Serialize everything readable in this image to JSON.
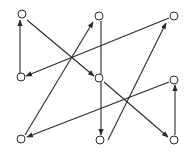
{
  "diagram": {
    "type": "directed-graph",
    "background": "#ffffff",
    "stroke_color": "#2a2a2a",
    "node_radius": 4,
    "nodes": [
      {
        "id": "TL",
        "x": 22,
        "y": 14
      },
      {
        "id": "TM",
        "x": 99,
        "y": 16
      },
      {
        "id": "TR",
        "x": 174,
        "y": 16
      },
      {
        "id": "ML",
        "x": 21,
        "y": 77
      },
      {
        "id": "MM",
        "x": 99,
        "y": 78
      },
      {
        "id": "MR",
        "x": 174,
        "y": 80
      },
      {
        "id": "BL",
        "x": 21,
        "y": 139
      },
      {
        "id": "BM",
        "x": 100,
        "y": 140
      },
      {
        "id": "BR",
        "x": 174,
        "y": 140
      }
    ],
    "edges": [
      {
        "from": "ML",
        "to": "TL",
        "x1": 20,
        "y1": 73,
        "x2": 20,
        "y2": 20
      },
      {
        "from": "TL",
        "to": "MM",
        "x1": 27,
        "y1": 20,
        "x2": 94,
        "y2": 76
      },
      {
        "from": "TR",
        "to": "ML",
        "x1": 169,
        "y1": 18,
        "x2": 26,
        "y2": 76
      },
      {
        "from": "TM",
        "to": "BM",
        "x1": 101,
        "y1": 21,
        "x2": 101,
        "y2": 135
      },
      {
        "from": "BM",
        "to": "TR",
        "x1": 108,
        "y1": 140,
        "x2": 166,
        "y2": 23
      },
      {
        "from": "MM",
        "to": "BR",
        "x1": 104,
        "y1": 82,
        "x2": 168,
        "y2": 137
      },
      {
        "from": "MR",
        "to": "BL",
        "x1": 169,
        "y1": 82,
        "x2": 27,
        "y2": 137
      },
      {
        "from": "BL",
        "to": "TM",
        "x1": 25,
        "y1": 135,
        "x2": 93,
        "y2": 22
      },
      {
        "from": "BR",
        "to": "MR",
        "x1": 175,
        "y1": 135,
        "x2": 175,
        "y2": 85
      }
    ]
  }
}
